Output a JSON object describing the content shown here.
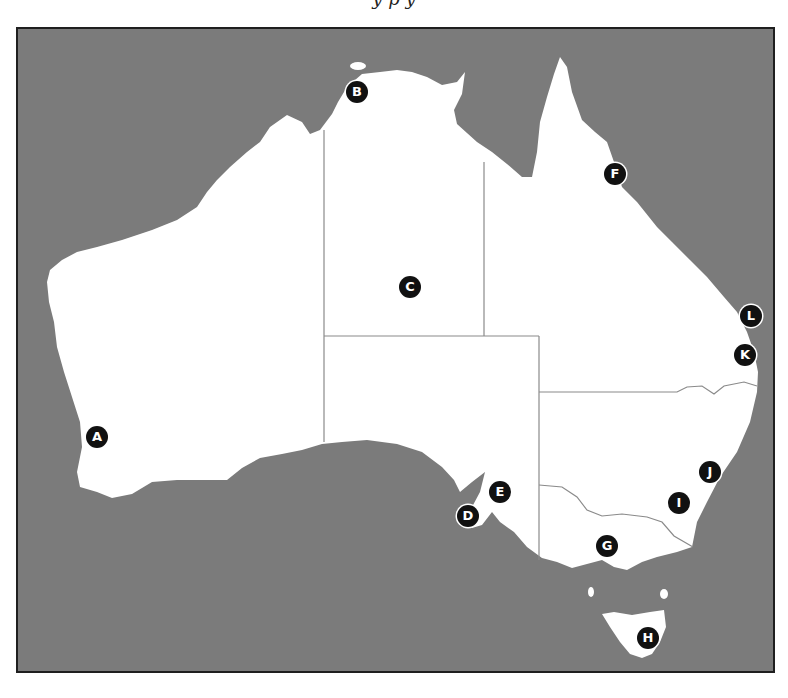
{
  "title": {
    "text": "y p y"
  },
  "map": {
    "ocean_color": "#7b7b7b",
    "land_color": "#ffffff",
    "border_color": "#1f1f1f",
    "state_line_color": "#8a8a8a"
  },
  "markers": [
    {
      "label": "A",
      "x": 97,
      "y": 437
    },
    {
      "label": "B",
      "x": 357,
      "y": 92
    },
    {
      "label": "C",
      "x": 410,
      "y": 287
    },
    {
      "label": "D",
      "x": 468,
      "y": 516
    },
    {
      "label": "E",
      "x": 500,
      "y": 492
    },
    {
      "label": "F",
      "x": 615,
      "y": 174
    },
    {
      "label": "G",
      "x": 607,
      "y": 546
    },
    {
      "label": "H",
      "x": 648,
      "y": 638
    },
    {
      "label": "I",
      "x": 679,
      "y": 503
    },
    {
      "label": "J",
      "x": 710,
      "y": 472
    },
    {
      "label": "K",
      "x": 745,
      "y": 355
    },
    {
      "label": "L",
      "x": 751,
      "y": 316
    }
  ]
}
